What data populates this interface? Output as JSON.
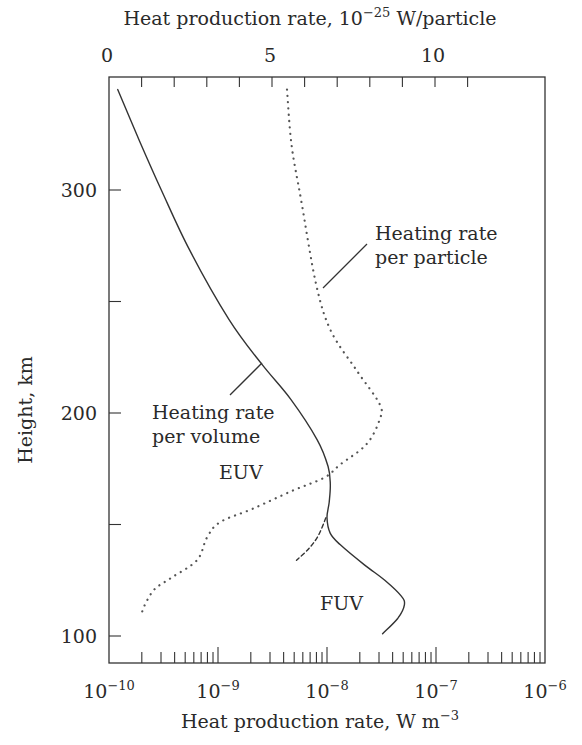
{
  "chart_data": {
    "type": "line",
    "title": "",
    "top_axis": {
      "label": "Heat production rate, 10^-25 W/particle",
      "label_main": "Heat production rate, 10",
      "label_exp": "−25",
      "label_unit": " W/particle",
      "scale": "linear",
      "range": [
        0,
        13.35
      ],
      "tick_labels": [
        {
          "value": 0,
          "text": "0"
        },
        {
          "value": 5,
          "text": "5"
        },
        {
          "value": 10,
          "text": "10"
        }
      ],
      "minor_ticks": [
        1,
        2,
        3,
        4,
        5,
        6,
        7,
        8,
        9,
        10,
        11
      ]
    },
    "bottom_axis": {
      "label": "Heat production rate, W m^-3",
      "label_main": "Heat production rate, W m",
      "label_exp": "−3",
      "scale": "log",
      "range": [
        1e-10,
        1e-06
      ],
      "tick_labels": [
        {
          "exp": -10,
          "base": "10",
          "sup": "−10"
        },
        {
          "exp": -9,
          "base": "10",
          "sup": "−9"
        },
        {
          "exp": -8,
          "base": "10",
          "sup": "−8"
        },
        {
          "exp": -7,
          "base": "10",
          "sup": "−7"
        },
        {
          "exp": -6,
          "base": "10",
          "sup": "−6"
        }
      ]
    },
    "left_axis": {
      "label": "Height, km",
      "range": [
        88,
        346
      ],
      "tick_labels": [
        {
          "value": 100,
          "text": "100"
        },
        {
          "value": 200,
          "text": "200"
        },
        {
          "value": 300,
          "text": "300"
        }
      ],
      "minor_ticks": [
        150,
        250
      ]
    },
    "grid": false,
    "series": [
      {
        "name": "Heating rate per volume",
        "axis": "bottom",
        "style": "solid",
        "points": [
          {
            "log_x": -9.92,
            "y": 345
          },
          {
            "log_x": -9.72,
            "y": 322
          },
          {
            "log_x": -9.52,
            "y": 300
          },
          {
            "log_x": -9.26,
            "y": 273
          },
          {
            "log_x": -8.9,
            "y": 242
          },
          {
            "log_x": -8.6,
            "y": 222
          },
          {
            "log_x": -8.33,
            "y": 206
          },
          {
            "log_x": -8.09,
            "y": 188
          },
          {
            "log_x": -7.99,
            "y": 176
          },
          {
            "log_x": -7.97,
            "y": 168
          },
          {
            "log_x": -7.98,
            "y": 160
          },
          {
            "log_x": -8.0,
            "y": 153
          },
          {
            "log_x": -7.97,
            "y": 146
          },
          {
            "log_x": -7.88,
            "y": 141
          },
          {
            "log_x": -7.66,
            "y": 132
          },
          {
            "log_x": -7.47,
            "y": 125
          },
          {
            "log_x": -7.32,
            "y": 118
          },
          {
            "log_x": -7.29,
            "y": 114
          },
          {
            "log_x": -7.35,
            "y": 108
          },
          {
            "log_x": -7.49,
            "y": 101
          }
        ]
      },
      {
        "name": "FUV alternative (dashed)",
        "axis": "bottom",
        "style": "dashed",
        "points": [
          {
            "log_x": -8.01,
            "y": 153
          },
          {
            "log_x": -8.08,
            "y": 145
          },
          {
            "log_x": -8.17,
            "y": 139
          },
          {
            "log_x": -8.28,
            "y": 134
          }
        ]
      },
      {
        "name": "Heating rate per particle",
        "axis": "top",
        "style": "dotted",
        "points": [
          {
            "x": 5.46,
            "y": 345
          },
          {
            "x": 5.6,
            "y": 320
          },
          {
            "x": 5.9,
            "y": 295
          },
          {
            "x": 6.35,
            "y": 258
          },
          {
            "x": 6.8,
            "y": 237
          },
          {
            "x": 7.6,
            "y": 219
          },
          {
            "x": 8.3,
            "y": 204
          },
          {
            "x": 8.3,
            "y": 197
          },
          {
            "x": 7.9,
            "y": 186
          },
          {
            "x": 7.1,
            "y": 177
          },
          {
            "x": 6.6,
            "y": 171
          },
          {
            "x": 5.6,
            "y": 165
          },
          {
            "x": 4.4,
            "y": 157
          },
          {
            "x": 3.4,
            "y": 151
          },
          {
            "x": 3.0,
            "y": 144
          },
          {
            "x": 2.7,
            "y": 134
          },
          {
            "x": 1.9,
            "y": 126
          },
          {
            "x": 1.4,
            "y": 121
          },
          {
            "x": 1.1,
            "y": 114
          },
          {
            "x": 1.0,
            "y": 110
          }
        ]
      }
    ],
    "annotations": [
      {
        "id": "per_particle",
        "lines": [
          "Heating rate",
          "per particle"
        ],
        "leader": {
          "from": {
            "x": 6.48,
            "y": 257
          },
          "to": {
            "x": 7.95,
            "y": 277
          }
        }
      },
      {
        "id": "per_volume",
        "lines": [
          "Heating rate",
          "per volume"
        ],
        "leader": {
          "from": {
            "log_x": -8.61,
            "y": 222
          },
          "to": {
            "log_x": -8.91,
            "y": 207
          }
        }
      },
      {
        "id": "euv",
        "lines": [
          "EUV"
        ]
      },
      {
        "id": "fuv",
        "lines": [
          "FUV"
        ]
      }
    ]
  }
}
